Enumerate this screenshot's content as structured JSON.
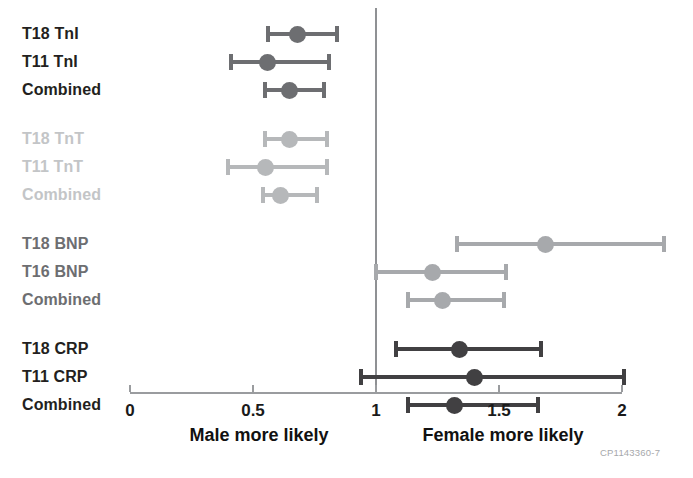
{
  "chart_data": {
    "type": "forest",
    "title": "",
    "xlabel": "",
    "ylabel": "",
    "xlim": [
      0,
      2
    ],
    "ticks": [
      0,
      0.5,
      1,
      1.5,
      2
    ],
    "tick_labels": [
      "0",
      "0.5",
      "1",
      "1.5",
      "2"
    ],
    "reference_line": 1,
    "grid": false,
    "legend": null,
    "left_caption": "Male more likely",
    "right_caption": "Female more likely",
    "watermark": "CP1143360-7",
    "colors": {
      "dark": "#58595b",
      "light": "#b6b8ba",
      "mid": "#939598",
      "darkest": "#414042",
      "label_dark": "#231f20",
      "label_light": "#c3c5c7",
      "label_mid": "#6d6e71",
      "axis": "#9a9c9f"
    },
    "groups": [
      {
        "name": "TnI",
        "label_color": "#231f20",
        "marker_color": "#6d6e71",
        "rows": [
          {
            "label": "T18 TnI",
            "estimate": 0.68,
            "low": 0.56,
            "high": 0.84
          },
          {
            "label": "T11 TnI",
            "estimate": 0.56,
            "low": 0.41,
            "high": 0.81
          },
          {
            "label": "Combined",
            "estimate": 0.65,
            "low": 0.55,
            "high": 0.79
          }
        ]
      },
      {
        "name": "TnT",
        "label_color": "#c3c5c7",
        "marker_color": "#b6b8ba",
        "rows": [
          {
            "label": "T18 TnT",
            "estimate": 0.65,
            "low": 0.55,
            "high": 0.8
          },
          {
            "label": "T11 TnT",
            "estimate": 0.55,
            "low": 0.4,
            "high": 0.8
          },
          {
            "label": "Combined",
            "estimate": 0.61,
            "low": 0.54,
            "high": 0.76
          }
        ]
      },
      {
        "name": "BNP",
        "label_color": "#6d6e71",
        "marker_color": "#a7a9ac",
        "rows": [
          {
            "label": "T18 BNP",
            "estimate": 1.69,
            "low": 1.33,
            "high": 2.17
          },
          {
            "label": "T16 BNP",
            "estimate": 1.23,
            "low": 1.0,
            "high": 1.53
          },
          {
            "label": "Combined",
            "estimate": 1.27,
            "low": 1.13,
            "high": 1.52
          }
        ]
      },
      {
        "name": "CRP",
        "label_color": "#231f20",
        "marker_color": "#414042",
        "rows": [
          {
            "label": "T18 CRP",
            "estimate": 1.34,
            "low": 1.08,
            "high": 1.67
          },
          {
            "label": "T11 CRP",
            "estimate": 1.4,
            "low": 0.94,
            "high": 2.01
          },
          {
            "label": "Combined",
            "estimate": 1.32,
            "low": 1.13,
            "high": 1.66
          }
        ]
      }
    ]
  }
}
